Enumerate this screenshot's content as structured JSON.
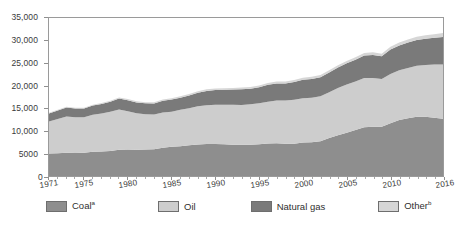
{
  "chart_data": {
    "type": "area",
    "stacked": true,
    "title": "",
    "subtitle": "",
    "xlabel": "",
    "ylabel": "",
    "grid": false,
    "legend_position": "bottom",
    "xlim": [
      1971,
      2016
    ],
    "ylim": [
      0,
      35000
    ],
    "y_ticks": [
      0,
      5000,
      10000,
      15000,
      20000,
      25000,
      30000,
      35000
    ],
    "y_tick_labels": [
      "0",
      "5000",
      "10,000",
      "15,000",
      "20,000",
      "25,000",
      "30,000",
      "35,000"
    ],
    "x_ticks": [
      1971,
      1975,
      1980,
      1985,
      1990,
      1995,
      2000,
      2005,
      2010,
      2016
    ],
    "x_tick_labels": [
      "1971",
      "1975",
      "1980",
      "1985",
      "1990",
      "1995",
      "2000",
      "2005",
      "2010",
      "2016"
    ],
    "x": [
      1971,
      1972,
      1973,
      1974,
      1975,
      1976,
      1977,
      1978,
      1979,
      1980,
      1981,
      1982,
      1983,
      1984,
      1985,
      1986,
      1987,
      1988,
      1989,
      1990,
      1991,
      1992,
      1993,
      1994,
      1995,
      1996,
      1997,
      1998,
      1999,
      2000,
      2001,
      2002,
      2003,
      2004,
      2005,
      2006,
      2007,
      2008,
      2009,
      2010,
      2011,
      2012,
      2013,
      2014,
      2015,
      2016
    ],
    "series": [
      {
        "name": "Coal",
        "label": "Coal",
        "superscript": "a",
        "color": "#8e8e8e",
        "values": [
          5000,
          5050,
          5150,
          5100,
          5150,
          5350,
          5450,
          5550,
          5800,
          5850,
          5800,
          5850,
          5950,
          6250,
          6500,
          6600,
          6800,
          7000,
          7100,
          7100,
          7050,
          6950,
          6950,
          6950,
          7050,
          7200,
          7250,
          7150,
          7150,
          7400,
          7500,
          7700,
          8400,
          9000,
          9600,
          10200,
          10800,
          10900,
          10900,
          11700,
          12400,
          12800,
          13100,
          13100,
          12900,
          12700
        ]
      },
      {
        "name": "Oil",
        "label": "Oil",
        "superscript": "",
        "color": "#cdcdcd",
        "values": [
          7100,
          7600,
          8050,
          7900,
          7850,
          8200,
          8400,
          8700,
          8950,
          8500,
          8100,
          7850,
          7700,
          7800,
          7750,
          8050,
          8200,
          8450,
          8600,
          8700,
          8750,
          8850,
          8800,
          8950,
          9050,
          9250,
          9500,
          9550,
          9750,
          9800,
          9850,
          9950,
          10150,
          10500,
          10650,
          10750,
          10900,
          10800,
          10600,
          10900,
          11000,
          11100,
          11300,
          11500,
          11800,
          12000
        ]
      },
      {
        "name": "Natural gas",
        "label": "Natural gas",
        "superscript": "",
        "color": "#7a7a7a",
        "values": [
          1750,
          1850,
          1950,
          1950,
          1950,
          2050,
          2100,
          2200,
          2400,
          2450,
          2400,
          2400,
          2400,
          2600,
          2700,
          2700,
          2850,
          3000,
          3150,
          3250,
          3300,
          3350,
          3450,
          3450,
          3550,
          3750,
          3750,
          3800,
          3950,
          4100,
          4150,
          4250,
          4400,
          4550,
          4700,
          4800,
          5000,
          5100,
          5000,
          5400,
          5500,
          5650,
          5750,
          5800,
          5900,
          6100
        ]
      },
      {
        "name": "Other",
        "label": "Other",
        "superscript": "b",
        "color": "#d6d6d6",
        "values": [
          150,
          160,
          170,
          180,
          190,
          200,
          210,
          220,
          230,
          240,
          250,
          260,
          270,
          290,
          300,
          310,
          320,
          330,
          340,
          350,
          360,
          370,
          380,
          390,
          400,
          410,
          420,
          430,
          440,
          450,
          460,
          470,
          490,
          510,
          530,
          550,
          570,
          590,
          600,
          630,
          660,
          690,
          720,
          760,
          800,
          850
        ]
      }
    ],
    "totals": [
      14000,
      14660,
      15320,
      15130,
      15140,
      15800,
      16160,
      16670,
      17380,
      17040,
      16550,
      16360,
      16320,
      16940,
      17250,
      17660,
      18170,
      18780,
      19190,
      19400,
      19460,
      19520,
      19580,
      19740,
      20050,
      20610,
      20920,
      20930,
      21290,
      21750,
      21960,
      22370,
      23440,
      24560,
      25480,
      26300,
      27270,
      27390,
      27100,
      28630,
      29560,
      30240,
      30870,
      31160,
      31400,
      31650
    ]
  },
  "legend": {
    "items": [
      {
        "label": "Coal",
        "superscript": "a",
        "color": "#8e8e8e"
      },
      {
        "label": "Oil",
        "superscript": "",
        "color": "#cdcdcd"
      },
      {
        "label": "Natural gas",
        "superscript": "",
        "color": "#7a7a7a"
      },
      {
        "label": "Other",
        "superscript": "b",
        "color": "#d6d6d6"
      }
    ]
  },
  "axis": {
    "zero_label": "0",
    "frame_color": "#9a9a9a"
  }
}
